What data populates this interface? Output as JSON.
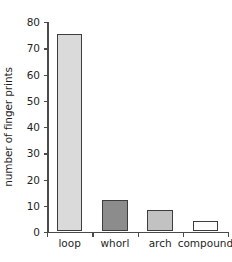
{
  "chart_data": {
    "type": "bar",
    "title": "",
    "xlabel": "",
    "ylabel": "number of finger prints",
    "categories": [
      "loop",
      "whorl",
      "arch",
      "compound"
    ],
    "values": [
      75,
      12,
      8,
      4
    ],
    "series": [
      {
        "name": "number of finger prints",
        "values": [
          75,
          12,
          8,
          4
        ]
      }
    ],
    "ylim": [
      0,
      80
    ],
    "yticks": [
      0,
      10,
      20,
      30,
      40,
      50,
      60,
      70,
      80
    ],
    "ytick_labels": [
      "0",
      "10",
      "20",
      "30",
      "40",
      "50",
      "60",
      "70",
      "80"
    ],
    "grid": false,
    "legend": false,
    "legend_position": "none",
    "bar_colors": [
      "#dadada",
      "#8c8c8c",
      "#c2c2c2",
      "#fdfdfd"
    ],
    "bar_edge_color": "#3d3d3d",
    "axis_color": "#4a4a4a",
    "background_color": "#ffffff",
    "bars": [
      {
        "label": "loop",
        "value": 75,
        "fill": "#dadada"
      },
      {
        "label": "whorl",
        "value": 12,
        "fill": "#8c8c8c"
      },
      {
        "label": "arch",
        "value": 8,
        "fill": "#c2c2c2"
      },
      {
        "label": "compound",
        "value": 4,
        "fill": "#fdfdfd"
      }
    ]
  }
}
